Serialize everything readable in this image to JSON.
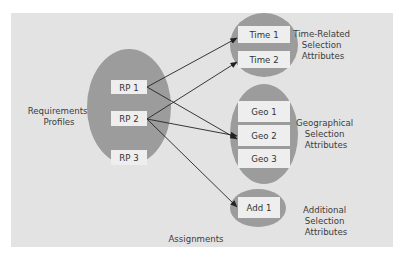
{
  "colors": {
    "panel": "#e3e3e3",
    "ellipse": "#9c9c9c",
    "box": "#eeeeee",
    "arrow": "#222222",
    "text": "#3c3c3c"
  },
  "groups": {
    "requirements": {
      "label": [
        "Requirements",
        "Profiles"
      ],
      "items": [
        "RP 1",
        "RP 2",
        "RP 3"
      ]
    },
    "time": {
      "label": [
        "Time-Related",
        "Selection",
        "Attributes"
      ],
      "items": [
        "Time 1",
        "Time 2"
      ]
    },
    "geo": {
      "label": [
        "Geographical",
        "Selection",
        "Attributes"
      ],
      "items": [
        "Geo 1",
        "Geo 2",
        "Geo 3"
      ]
    },
    "additional": {
      "label": [
        "Additional",
        "Selection",
        "Attributes"
      ],
      "items": [
        "Add 1"
      ]
    }
  },
  "assignments_label": "Assignments",
  "connections": [
    {
      "from": "RP 1",
      "to": "Time 1"
    },
    {
      "from": "RP 1",
      "to": "Geo 2"
    },
    {
      "from": "RP 2",
      "to": "Time 2"
    },
    {
      "from": "RP 2",
      "to": "Geo 2"
    },
    {
      "from": "RP 2",
      "to": "Add 1"
    }
  ]
}
